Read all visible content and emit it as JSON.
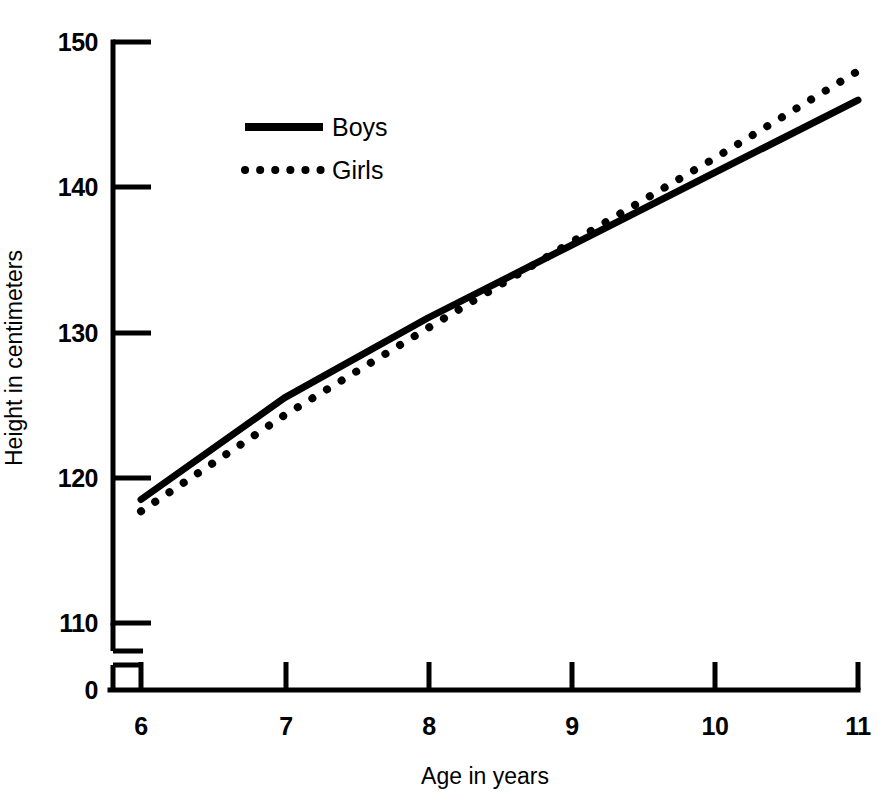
{
  "chart_data": {
    "type": "line",
    "title": "",
    "xlabel": "Age in years",
    "ylabel": "Height in centimeters",
    "x": [
      6,
      7,
      8,
      9,
      10,
      11
    ],
    "xtick_labels": [
      "6",
      "7",
      "8",
      "9",
      "10",
      "11"
    ],
    "ytick_labels": [
      "110",
      "120",
      "130",
      "140",
      "150"
    ],
    "ytick_values": [
      110,
      120,
      130,
      140,
      150
    ],
    "y_origin_label": "0",
    "xlim": [
      6,
      11
    ],
    "ylim": [
      110,
      150
    ],
    "axis_break": true,
    "grid": false,
    "legend_position": "upper-left-inside",
    "series": [
      {
        "name": "Boys",
        "style": "solid",
        "color": "#000000",
        "values": [
          118.5,
          125.5,
          131.0,
          136.0,
          141.0,
          146.0
        ]
      },
      {
        "name": "Girls",
        "style": "dotted",
        "color": "#000000",
        "values": [
          117.7,
          124.3,
          130.3,
          136.2,
          142.0,
          148.0
        ]
      }
    ]
  },
  "legend": {
    "items": [
      {
        "label": "Boys",
        "style": "solid"
      },
      {
        "label": "Girls",
        "style": "dotted"
      }
    ]
  },
  "axes": {
    "y_title": "Height in centimeters",
    "x_title": "Age in years"
  }
}
